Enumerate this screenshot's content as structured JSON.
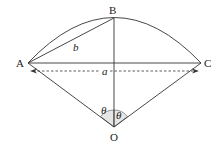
{
  "diagram": {
    "type": "circular sector with chords",
    "points": {
      "A": {
        "label": "A",
        "x": 28,
        "y": 63
      },
      "B": {
        "label": "B",
        "x": 114,
        "y": 18
      },
      "C": {
        "label": "C",
        "x": 201,
        "y": 63
      },
      "O": {
        "label": "O",
        "x": 114,
        "y": 127
      }
    },
    "segment_labels": {
      "b": "b",
      "a": "a"
    },
    "angle_labels": {
      "left": "θ",
      "right": "θ"
    },
    "colors": {
      "line": "#333333",
      "angle_fill": "#e6e6e6"
    }
  }
}
